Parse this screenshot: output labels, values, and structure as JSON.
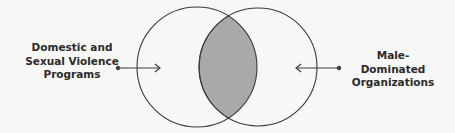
{
  "diagram": {
    "type": "venn",
    "sets": [
      {
        "id": "left",
        "label_lines": [
          "Domestic and",
          "Sexual Violence",
          "Programs"
        ]
      },
      {
        "id": "right",
        "label_lines": [
          "Male-Dominated",
          "Organizations"
        ]
      }
    ],
    "intersection_highlighted": true,
    "colors": {
      "stroke": "#3a3a3a",
      "intersection_fill": "#a9a9a9",
      "background": "#f7f7f5"
    }
  }
}
